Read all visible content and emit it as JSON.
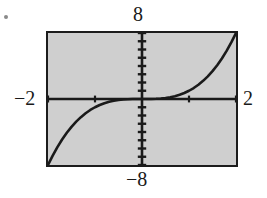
{
  "figure": {
    "kind": "graphing-calculator-plot",
    "background_color": "#ffffff",
    "plot_background_color": "#cfcfcf",
    "frame_color": "#1c1c1c",
    "curve_color": "#1a1a1a",
    "axis_color": "#1a1a1a"
  },
  "labels": {
    "top": "8",
    "bottom": "−8",
    "left": "−2",
    "right": "2"
  },
  "chart_data": {
    "type": "line",
    "title": "",
    "subtitle": "",
    "xlabel": "",
    "ylabel": "",
    "xlim": [
      -2,
      2
    ],
    "ylim": [
      -8,
      8
    ],
    "xtick_labels": [
      "−2",
      "2"
    ],
    "ytick_labels": [
      "−8",
      "8"
    ],
    "xticks_visible": true,
    "yticks_visible": true,
    "xtick_step": 1,
    "ytick_step": 1,
    "grid": false,
    "legend": null,
    "legend_position": "none",
    "annotations": [],
    "series": [
      {
        "name": "y = x^3",
        "color": "#1a1a1a",
        "x": [
          -2.0,
          -1.9,
          -1.8,
          -1.7,
          -1.6,
          -1.5,
          -1.4,
          -1.3,
          -1.2,
          -1.1,
          -1.0,
          -0.9,
          -0.8,
          -0.7,
          -0.6,
          -0.5,
          -0.4,
          -0.3,
          -0.2,
          -0.1,
          0.0,
          0.1,
          0.2,
          0.3,
          0.4,
          0.5,
          0.6,
          0.7,
          0.8,
          0.9,
          1.0,
          1.1,
          1.2,
          1.3,
          1.4,
          1.5,
          1.6,
          1.7,
          1.8,
          1.9,
          2.0
        ],
        "y": [
          -8.0,
          -6.859,
          -5.832,
          -4.913,
          -4.096,
          -3.375,
          -2.744,
          -2.197,
          -1.728,
          -1.331,
          -1.0,
          -0.729,
          -0.512,
          -0.343,
          -0.216,
          -0.125,
          -0.064,
          -0.027,
          -0.008,
          -0.001,
          0.0,
          0.001,
          0.008,
          0.027,
          0.064,
          0.125,
          0.216,
          0.343,
          0.512,
          0.729,
          1.0,
          1.331,
          1.728,
          2.197,
          2.744,
          3.375,
          4.096,
          4.913,
          5.832,
          6.859,
          8.0
        ]
      }
    ]
  }
}
